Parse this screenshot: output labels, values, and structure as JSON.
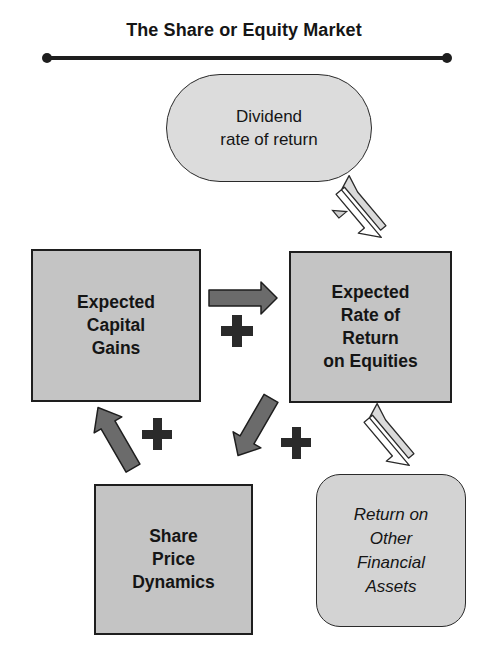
{
  "title": "The Share or Equity Market",
  "nodes": {
    "dividend": "Dividend\nrate of return",
    "capital_gains": "Expected\nCapital\nGains",
    "rate_of_return": "Expected\nRate of\nReturn\non Equities",
    "share_price": "Share\nPrice\nDynamics",
    "other_assets": "Return on\nOther\nFinancial\nAssets"
  },
  "signs": {
    "gains_to_return": "+",
    "price_to_gains": "+",
    "return_to_price": "+"
  },
  "edges": [
    {
      "from": "capital_gains",
      "to": "rate_of_return",
      "type": "directed",
      "sign": "+"
    },
    {
      "from": "share_price",
      "to": "capital_gains",
      "type": "directed",
      "sign": "+"
    },
    {
      "from": "rate_of_return",
      "to": "share_price",
      "type": "directed",
      "sign": "+"
    },
    {
      "from": "dividend",
      "to": "rate_of_return",
      "type": "bidirectional"
    },
    {
      "from": "rate_of_return",
      "to": "other_assets",
      "type": "bidirectional"
    }
  ],
  "colors": {
    "box_fill": "#c4c4c4",
    "pill_fill": "#dcdcdc",
    "arrow_dark": "#6b6b6b",
    "arrow_light": "#dadada",
    "stroke": "#1e1e1e"
  }
}
